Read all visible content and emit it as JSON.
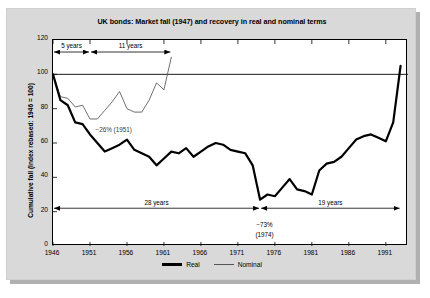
{
  "figure": {
    "title": "UK bonds: Market fall (1947) and recovery in real and nominal terms"
  },
  "legend": {
    "position": "bottom-center",
    "items": [
      {
        "label": "Real",
        "style": "thick-black-line",
        "color": "#000000"
      },
      {
        "label": "Nominal",
        "style": "thin-gray-line",
        "color": "#555555"
      }
    ]
  },
  "annotations": {
    "span_5_years": "5 years",
    "span_11_years": "11 years",
    "span_28_years": "28 years",
    "span_19_years": "19 years",
    "nominal_trough": "−26% (1951)",
    "real_trough_pct": "−73%",
    "real_trough_year": "(1974)"
  },
  "chart_data": {
    "type": "line",
    "title": "UK bonds: Market fall (1947) and recovery in real and nominal terms",
    "xlabel": "",
    "ylabel": "Cumulative fall (Index rebased: 1946 = 100)",
    "xlim": [
      1946,
      1994
    ],
    "ylim": [
      0,
      120
    ],
    "yticks": [
      0,
      20,
      40,
      60,
      80,
      100,
      120
    ],
    "xticks": [
      1946,
      1951,
      1956,
      1961,
      1966,
      1971,
      1976,
      1981,
      1986,
      1991
    ],
    "grid": false,
    "reference_line": {
      "y": 100,
      "label": "1946 = 100"
    },
    "series": [
      {
        "name": "Real",
        "color": "#000000",
        "width": "thick",
        "x": [
          1946,
          1947,
          1948,
          1949,
          1950,
          1951,
          1952,
          1953,
          1954,
          1955,
          1956,
          1957,
          1958,
          1959,
          1960,
          1961,
          1962,
          1963,
          1964,
          1965,
          1966,
          1967,
          1968,
          1969,
          1970,
          1971,
          1972,
          1973,
          1974,
          1975,
          1976,
          1977,
          1978,
          1979,
          1980,
          1981,
          1982,
          1983,
          1984,
          1985,
          1986,
          1987,
          1988,
          1989,
          1990,
          1991,
          1992,
          1993
        ],
        "y": [
          100,
          85,
          82,
          72,
          71,
          65,
          60,
          55,
          57,
          59,
          62,
          56,
          54,
          52,
          47,
          51,
          55,
          54,
          57,
          52,
          55,
          58,
          60,
          59,
          56,
          55,
          54,
          47,
          27,
          30,
          29,
          34,
          39,
          33,
          32,
          30,
          44,
          48,
          49,
          52,
          57,
          62,
          64,
          65,
          63,
          61,
          72,
          105
        ]
      },
      {
        "name": "Nominal",
        "color": "#555555",
        "width": "thin",
        "x": [
          1946,
          1947,
          1948,
          1949,
          1950,
          1951,
          1952,
          1953,
          1954,
          1955,
          1956,
          1957,
          1958,
          1959,
          1960,
          1961,
          1962
        ],
        "y": [
          100,
          87,
          86,
          81,
          82,
          74,
          74,
          79,
          84,
          90,
          80,
          78,
          78,
          85,
          95,
          91,
          110
        ]
      }
    ],
    "callouts": [
      {
        "text": "−26% (1951)",
        "x": 1953,
        "y": 70
      },
      {
        "text": "−73% (1974)",
        "x": 1974,
        "y": 16
      }
    ],
    "span_arrows": [
      {
        "label": "5 years",
        "from": 1946,
        "to": 1951,
        "y": 113
      },
      {
        "label": "11 years",
        "from": 1951,
        "to": 1962,
        "y": 113
      },
      {
        "label": "28 years",
        "from": 1946,
        "to": 1974,
        "y": 22
      },
      {
        "label": "19 years",
        "from": 1974,
        "to": 1993,
        "y": 22
      }
    ]
  }
}
